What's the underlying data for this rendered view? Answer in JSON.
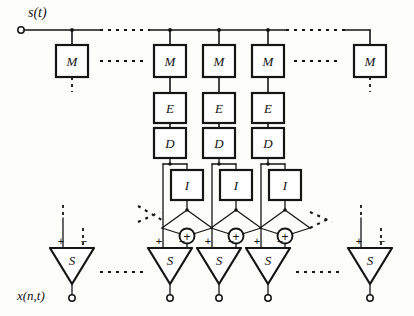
{
  "diagram": {
    "input_signal_label": "s(t)",
    "output_signal_label": "x(n,t)",
    "stroke_color": "#151515",
    "background_color": "#fdfdfc",
    "bus": {
      "name": "input-bus",
      "y": 30,
      "x_start": 20,
      "x_end": 370,
      "terminal_marker": "open-circle",
      "dashed_gaps": [
        [
          100,
          150
        ],
        [
          285,
          345
        ]
      ]
    },
    "columns": [
      {
        "id": "col-left-outer",
        "x": 72,
        "blocks": [
          "M"
        ],
        "has_interpolator": false,
        "truncated_dotted": true
      },
      {
        "id": "col-1",
        "x": 170,
        "blocks": [
          "M",
          "E",
          "D"
        ],
        "has_interpolator": true,
        "truncated_dotted": false
      },
      {
        "id": "col-2",
        "x": 219,
        "blocks": [
          "M",
          "E",
          "D"
        ],
        "has_interpolator": true,
        "truncated_dotted": false
      },
      {
        "id": "col-3",
        "x": 268,
        "blocks": [
          "M",
          "E",
          "D"
        ],
        "has_interpolator": true,
        "truncated_dotted": false
      },
      {
        "id": "col-right-outer",
        "x": 370,
        "blocks": [
          "M"
        ],
        "has_interpolator": false,
        "truncated_dotted": true
      }
    ],
    "block_labels": {
      "modulator": "M",
      "encoder": "E",
      "decoder": "D",
      "interpolator": "I",
      "summer": "S"
    },
    "rows": {
      "M": {
        "label": "M",
        "y_top": 45,
        "height": 32
      },
      "E": {
        "label": "E",
        "y_top": 93,
        "height": 30
      },
      "D": {
        "label": "D",
        "y_top": 128,
        "height": 30
      },
      "I": {
        "label": "I",
        "y_top": 170,
        "height": 30
      },
      "S": {
        "label": "S",
        "y_top": 248,
        "height": 36
      }
    },
    "box_width": 32,
    "summer_nodes": [
      {
        "id": "adder-1",
        "cx": 187,
        "cy": 236,
        "symbol": "+"
      },
      {
        "id": "adder-2",
        "cx": 236,
        "cy": 236,
        "symbol": "+"
      },
      {
        "id": "adder-3",
        "cx": 285,
        "cy": 236,
        "symbol": "+"
      }
    ],
    "summer_triangles": [
      {
        "id": "s-left-outer",
        "cx": 72,
        "plus": "+",
        "minus": "−",
        "plus_input": "solid",
        "minus_input": "dotted"
      },
      {
        "id": "s-1",
        "cx": 170,
        "plus": "+",
        "minus": "−",
        "plus_input": "solid",
        "minus_input": "solid"
      },
      {
        "id": "s-2",
        "cx": 219,
        "plus": "+",
        "minus": "−",
        "plus_input": "solid",
        "minus_input": "solid"
      },
      {
        "id": "s-3",
        "cx": 268,
        "plus": "+",
        "minus": "−",
        "plus_input": "solid",
        "minus_input": "solid"
      },
      {
        "id": "s-right-outer",
        "cx": 370,
        "plus": "+",
        "minus": "−",
        "plus_input": "solid",
        "minus_input": "dotted"
      }
    ],
    "ellipses_dotted_runs": [
      {
        "id": "ellipsis-top-left",
        "x1": 100,
        "x2": 150,
        "y": 30
      },
      {
        "id": "ellipsis-top-right",
        "x1": 286,
        "x2": 345,
        "y": 30
      },
      {
        "id": "ellipsis-m-row-left",
        "x1": 100,
        "x2": 148,
        "y": 61
      },
      {
        "id": "ellipsis-m-row-right",
        "x1": 292,
        "x2": 340,
        "y": 61
      },
      {
        "id": "ellipsis-s-row-left",
        "x1": 98,
        "x2": 148,
        "y": 272
      },
      {
        "id": "ellipsis-s-row-right",
        "x1": 292,
        "x2": 342,
        "y": 272
      }
    ],
    "crossover": {
      "name": "interleaved-crossover-network",
      "description": "Each interpolator output fans out diagonally left and right to neighbouring adder nodes, forming X crossings.",
      "fan_y_top": 200,
      "fan_y_bottom": 228,
      "dashed_stub_left": true,
      "dashed_stub_right": true
    }
  }
}
